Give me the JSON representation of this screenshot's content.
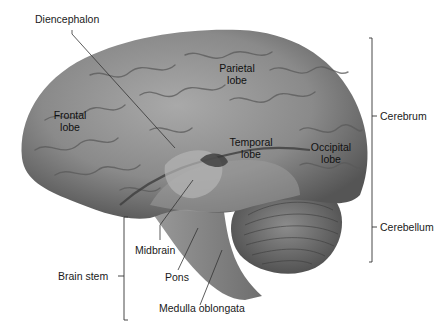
{
  "figure": {
    "labels": {
      "diencephalon": "Diencephalon",
      "frontal_lobe": [
        "Frontal",
        "lobe"
      ],
      "parietal_lobe": [
        "Parietal",
        "lobe"
      ],
      "temporal_lobe": [
        "Temporal",
        "lobe"
      ],
      "occipital_lobe": [
        "Occipital",
        "lobe"
      ],
      "midbrain": "Midbrain",
      "pons": "Pons",
      "medulla": "Medulla oblongata",
      "brain_stem": "Brain stem"
    },
    "brackets": {
      "cerebrum": "Cerebrum",
      "cerebellum": "Cerebellum"
    },
    "colors": {
      "brain_base": "#8a8a8a",
      "brain_light": "#b3b3b3",
      "brain_dark": "#4a4a4a",
      "leader_line": "#333333",
      "background": "#ffffff"
    }
  }
}
